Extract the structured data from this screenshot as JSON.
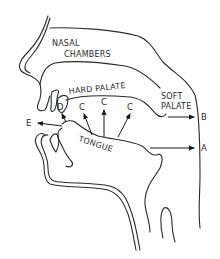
{
  "diagram": {
    "colors": {
      "line": "#2a2a2a",
      "background": "#ffffff"
    },
    "regions": {
      "nasal_line1": "NASAL",
      "nasal_line2": "CHAMBERS",
      "hard_palate": "HARD PALATE",
      "soft_palate_line1": "SOFT",
      "soft_palate_line2": "PALATE",
      "tongue": "TONGUE"
    },
    "markers": {
      "a": "A",
      "b": "B",
      "c1": "C",
      "c2": "C",
      "c3": "C",
      "d": "D",
      "e": "E"
    }
  }
}
